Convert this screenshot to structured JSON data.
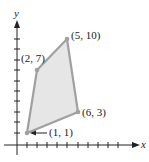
{
  "figure": {
    "type": "feasible-region-polygon",
    "axes": {
      "x_label": "x",
      "y_label": "y",
      "x_ticks": 11,
      "y_ticks": 11
    },
    "vertices": [
      {
        "x": 1,
        "y": 1,
        "label": "(1, 1)"
      },
      {
        "x": 6,
        "y": 3,
        "label": "(6, 3)"
      },
      {
        "x": 5,
        "y": 10,
        "label": "(5, 10)"
      },
      {
        "x": 2,
        "y": 7,
        "label": "(2, 7)"
      }
    ],
    "colors": {
      "fill": "#e6e6e6",
      "edge": "#a0a0a0",
      "axis": "#222222"
    }
  }
}
